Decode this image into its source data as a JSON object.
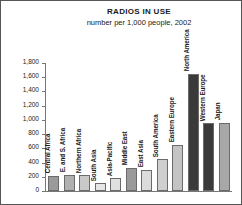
{
  "chart_data": {
    "type": "bar",
    "title": "RADIOS IN USE",
    "subtitle": "number per 1,000 people, 2002",
    "xlabel": "",
    "ylabel": "",
    "ylim": [
      0,
      1800
    ],
    "grid": false,
    "legend": "none",
    "ytick_labels": [
      "1,800",
      "1,600",
      "1,400",
      "1,200",
      "1,000",
      "800",
      "600",
      "400",
      "200",
      "0"
    ],
    "ytick_values": [
      1800,
      1600,
      1400,
      1200,
      1000,
      800,
      600,
      400,
      200,
      0
    ],
    "categories": [
      "Central Africa",
      "E. and S. Africa",
      "Northern Africa",
      "South Asia",
      "Asia-Pacific",
      "Middle East",
      "East Asia",
      "South America",
      "Eastern Europe",
      "North America",
      "Western Europe",
      "Japan"
    ],
    "values": [
      215,
      230,
      225,
      110,
      180,
      330,
      300,
      450,
      650,
      1650,
      950,
      960
    ],
    "bar_colors": [
      "#9a9a9a",
      "#b0b0b0",
      "#c9c9c9",
      "#e6e6e6",
      "#e0e0e0",
      "#9a9a9a",
      "#dcdcdc",
      "#cfcfcf",
      "#c4c4c4",
      "#3a3a3a",
      "#3a3a3a",
      "#a8a8a8"
    ]
  },
  "frame": {
    "border_color": "#555555",
    "axis_color": "#777777",
    "text_color": "#1a1a1a"
  }
}
